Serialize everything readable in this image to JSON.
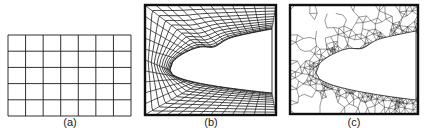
{
  "figure": {
    "panels": [
      {
        "id": "a",
        "label": "(a)",
        "description": "structured rectangular grid",
        "columns": 7,
        "rows": 5
      },
      {
        "id": "b",
        "label": "(b)",
        "description": "body-fitted structured curvilinear mesh around airfoil-shaped cutout"
      },
      {
        "id": "c",
        "label": "(c)",
        "description": "unstructured triangular mesh around airfoil-shaped cutout"
      }
    ]
  },
  "colors": {
    "line": "#1a1a1a",
    "border": "#111111",
    "background": "#ffffff"
  }
}
